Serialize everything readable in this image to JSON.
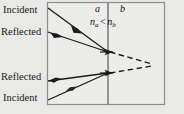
{
  "figure": {
    "kind": "optics-reflection-refraction-diagram",
    "background_color": "#e9e9e7",
    "panel_color": "#ececea",
    "border_color": "#8d8d8d",
    "ray_color": "#1a1a1a",
    "interface_color": "#6f6f6f"
  },
  "labels": {
    "incident_top": "Incident",
    "reflected_top": "Reflected",
    "reflected_bottom": "Reflected",
    "incident_bottom": "Incident",
    "medium_a": "a",
    "medium_b": "b",
    "index_n": "n",
    "index_sub_a": "a",
    "index_relation": "<",
    "index_sub_b": "b"
  },
  "geometry": {
    "panel": {
      "x": 47,
      "y": 2,
      "width": 118,
      "height": 103
    },
    "interface_x": 108,
    "rays": [
      {
        "name": "incident-ray-top",
        "type": "solid",
        "from": [
          48,
          8
        ],
        "to": [
          108,
          52
        ],
        "arrow_at": 0.5
      },
      {
        "name": "reflected-ray-top",
        "type": "solid",
        "from": [
          108,
          52
        ],
        "to": [
          48,
          32
        ],
        "arrow_at": 0.55
      },
      {
        "name": "incident-ray-bottom",
        "type": "solid",
        "from": [
          48,
          100
        ],
        "to": [
          108,
          73
        ],
        "arrow_at": 0.45
      },
      {
        "name": "reflected-ray-bottom",
        "type": "solid",
        "from": [
          108,
          73
        ],
        "to": [
          48,
          81
        ],
        "arrow_at": 0.93
      },
      {
        "name": "refracted-ray-top",
        "type": "dashed",
        "from": [
          108,
          52
        ],
        "to": [
          152,
          64
        ],
        "arrow_at": 0.0
      },
      {
        "name": "refracted-ray-bottom",
        "type": "dashed",
        "from": [
          108,
          73
        ],
        "to": [
          152,
          66
        ],
        "arrow_at": 0.0
      }
    ]
  }
}
